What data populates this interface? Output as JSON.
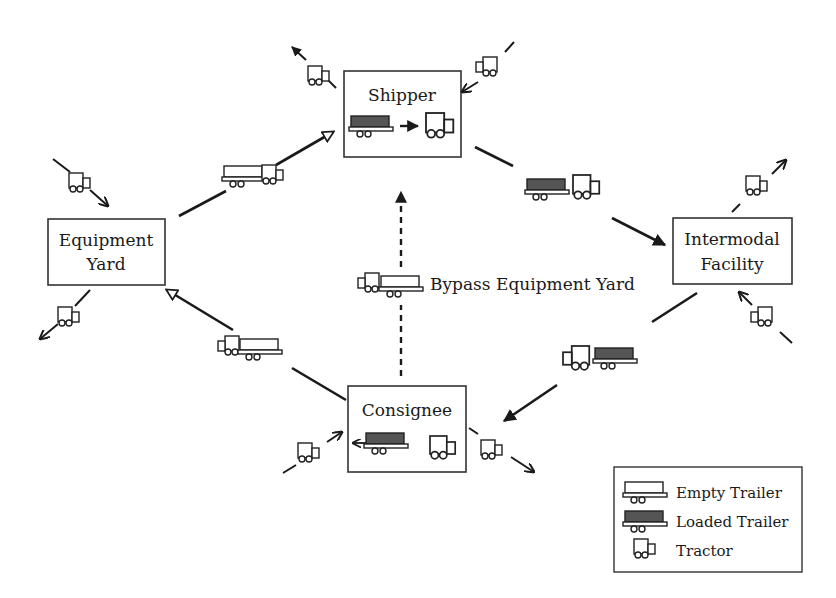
{
  "diagram": {
    "nodes": {
      "shipper": "Shipper",
      "equipment_yard_line1": "Equipment",
      "equipment_yard_line2": "Yard",
      "intermodal_line1": "Intermodal",
      "intermodal_line2": "Facility",
      "consignee": "Consignee"
    },
    "bypass_label": "Bypass Equipment Yard",
    "edges": [
      {
        "from": "Equipment Yard",
        "to": "Shipper",
        "carrying": "empty trailer + tractor",
        "style": "solid, open arrow"
      },
      {
        "from": "Shipper",
        "to": "Intermodal Facility",
        "carrying": "loaded trailer + tractor",
        "style": "solid, filled arrow"
      },
      {
        "from": "Intermodal Facility",
        "to": "Consignee",
        "carrying": "loaded trailer + tractor",
        "style": "solid, filled arrow"
      },
      {
        "from": "Consignee",
        "to": "Equipment Yard",
        "carrying": "empty trailer + tractor",
        "style": "solid, open arrow"
      },
      {
        "from": "Consignee",
        "to": "Shipper",
        "carrying": "empty trailer + tractor",
        "style": "dashed, bypass"
      }
    ],
    "legend": {
      "empty_trailer": "Empty Trailer",
      "loaded_trailer": "Loaded Trailer",
      "tractor": "Tractor"
    },
    "colors": {
      "line": "#1a1a1a",
      "loaded_fill": "#555555",
      "box_stroke": "#333333",
      "background": "#ffffff"
    }
  }
}
